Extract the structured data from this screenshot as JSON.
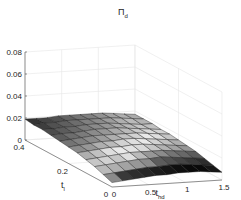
{
  "chart_data": {
    "type": "surface3d",
    "title_main": "Π",
    "title_sub": "d",
    "xlabel": "t_hd",
    "xlabel_main": "t",
    "xlabel_sub": "hd",
    "ylabel": "t_l",
    "ylabel_main": "t",
    "ylabel_sub": "l",
    "zlabel": "",
    "xlim": [
      0,
      1.5
    ],
    "ylim": [
      0,
      0.4
    ],
    "zlim": [
      0,
      0.08
    ],
    "xticks": [
      "0",
      "0.5",
      "1",
      "1.5"
    ],
    "yticks": [
      "0",
      "0.2",
      "0.4"
    ],
    "zticks": [
      "0",
      "0.02",
      "0.04",
      "0.06",
      "0.08"
    ],
    "grid": true,
    "colormap": "gray",
    "x": [
      0,
      0.15,
      0.3,
      0.45,
      0.6,
      0.75,
      0.9,
      1.05,
      1.2,
      1.35,
      1.5
    ],
    "y": [
      0,
      0.04,
      0.08,
      0.12,
      0.16,
      0.2,
      0.24,
      0.28,
      0.32,
      0.36,
      0.4
    ],
    "z_note": "approximate surface heights (rows = y, cols = x)",
    "z": [
      [
        0.004,
        0.005,
        0.006,
        0.007,
        0.008,
        0.008,
        0.009,
        0.009,
        0.009,
        0.008,
        0.007
      ],
      [
        0.007,
        0.008,
        0.009,
        0.01,
        0.011,
        0.011,
        0.012,
        0.012,
        0.011,
        0.01,
        0.009
      ],
      [
        0.01,
        0.011,
        0.012,
        0.013,
        0.014,
        0.014,
        0.015,
        0.014,
        0.013,
        0.012,
        0.011
      ],
      [
        0.012,
        0.013,
        0.014,
        0.015,
        0.016,
        0.016,
        0.016,
        0.016,
        0.015,
        0.014,
        0.013
      ],
      [
        0.014,
        0.015,
        0.016,
        0.017,
        0.017,
        0.018,
        0.018,
        0.017,
        0.016,
        0.015,
        0.014
      ],
      [
        0.015,
        0.016,
        0.017,
        0.018,
        0.018,
        0.019,
        0.019,
        0.018,
        0.017,
        0.016,
        0.015
      ],
      [
        0.016,
        0.017,
        0.018,
        0.019,
        0.019,
        0.019,
        0.019,
        0.019,
        0.018,
        0.017,
        0.016
      ],
      [
        0.017,
        0.018,
        0.018,
        0.019,
        0.02,
        0.02,
        0.02,
        0.019,
        0.018,
        0.017,
        0.016
      ],
      [
        0.018,
        0.018,
        0.019,
        0.019,
        0.02,
        0.02,
        0.02,
        0.019,
        0.018,
        0.017,
        0.017
      ],
      [
        0.018,
        0.019,
        0.019,
        0.02,
        0.02,
        0.02,
        0.02,
        0.02,
        0.019,
        0.018,
        0.017
      ],
      [
        0.019,
        0.019,
        0.019,
        0.02,
        0.02,
        0.02,
        0.02,
        0.02,
        0.019,
        0.018,
        0.017
      ]
    ],
    "face_gray": [
      [
        0.55,
        0.2,
        0.15,
        0.12,
        0.08,
        0.05,
        0.02,
        0.0,
        0.0,
        0.05
      ],
      [
        0.75,
        0.7,
        0.65,
        0.6,
        0.55,
        0.35,
        0.3,
        0.25,
        0.2,
        0.15
      ],
      [
        0.8,
        0.85,
        0.8,
        0.9,
        0.75,
        0.6,
        0.55,
        0.45,
        0.4,
        0.35
      ],
      [
        0.7,
        0.78,
        0.9,
        0.95,
        0.92,
        0.88,
        0.8,
        0.72,
        0.65,
        0.6
      ],
      [
        0.55,
        0.6,
        0.7,
        0.75,
        0.85,
        0.9,
        0.95,
        0.85,
        0.78,
        0.7
      ],
      [
        0.45,
        0.5,
        0.55,
        0.62,
        0.7,
        0.78,
        0.85,
        0.95,
        0.9,
        0.8
      ],
      [
        0.35,
        0.42,
        0.48,
        0.55,
        0.6,
        0.68,
        0.75,
        0.82,
        0.88,
        0.85
      ],
      [
        0.28,
        0.35,
        0.4,
        0.48,
        0.55,
        0.6,
        0.68,
        0.75,
        0.8,
        0.78
      ],
      [
        0.22,
        0.3,
        0.36,
        0.42,
        0.5,
        0.55,
        0.62,
        0.7,
        0.75,
        0.72
      ],
      [
        0.18,
        0.25,
        0.3,
        0.38,
        0.45,
        0.5,
        0.58,
        0.65,
        0.7,
        0.68
      ]
    ]
  }
}
